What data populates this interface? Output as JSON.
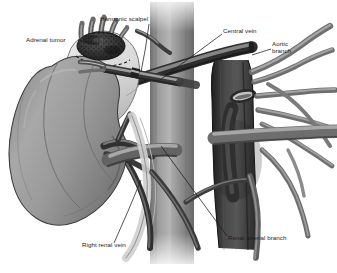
{
  "figure": {
    "type": "medical-illustration",
    "style": "grayscale line-and-tone anatomical drawing",
    "background_color": "#ffffff",
    "width": 337,
    "height": 273
  },
  "palette": {
    "background": "#ffffff",
    "kidney_fill": "#9a9a9a",
    "kidney_shadow": "#6f6f6f",
    "kidney_highlight": "#b5b5b5",
    "ivc_fill": "#8c8c8c",
    "ivc_highlight": "#b0b0b0",
    "ivc_shadow": "#6a6a6a",
    "aorta_fill": "#3d3d3d",
    "aorta_shadow": "#262626",
    "aorta_ostium": "#c9c9c9",
    "vein_dark": "#4a4a4a",
    "branch_gray": "#8f8f8f",
    "fat_pad": "#dedede",
    "tumor_dark": "#3a3a3a",
    "tumor_mottle": "#1e1e1e",
    "instrument": "#7c7c7c",
    "outline": "#2b2b2b",
    "label_text": "#1c1c1c",
    "leader_line": "#1c1c1c"
  },
  "labels": [
    {
      "id": "adrenal-tumor",
      "text": "Adrenal tumor",
      "x": 26,
      "y": 40,
      "align": "left",
      "lines": 1
    },
    {
      "id": "harmonic-scalpel",
      "text": "Harmonic scalpel",
      "x": 100,
      "y": 19,
      "align": "left",
      "lines": 1
    },
    {
      "id": "central-vein",
      "text": "Central vein",
      "x": 223,
      "y": 31,
      "align": "left",
      "lines": 1
    },
    {
      "id": "aortic-branch",
      "text": "Aortic\nbranch",
      "x": 272,
      "y": 44,
      "align": "left",
      "lines": 2
    },
    {
      "id": "right-renal-vein",
      "text": "Right renal vein",
      "x": 82,
      "y": 245,
      "align": "left",
      "lines": 1
    },
    {
      "id": "renal-arterial-branch",
      "text": "Renal arterial branch",
      "x": 228,
      "y": 238,
      "align": "left",
      "lines": 1
    }
  ],
  "leader_lines": [
    {
      "id": "leader-adrenal-tumor",
      "from": [
        78,
        40
      ],
      "to": [
        99,
        45
      ]
    },
    {
      "id": "leader-harmonic-scalpel",
      "from": [
        149,
        24
      ],
      "to": [
        141,
        72
      ]
    },
    {
      "id": "leader-central-vein",
      "from": [
        222,
        34
      ],
      "to": [
        160,
        80
      ]
    },
    {
      "id": "leader-aortic-branch",
      "from": [
        271,
        49
      ],
      "to": [
        252,
        55
      ]
    },
    {
      "id": "leader-right-renal-vein",
      "from": [
        114,
        243
      ],
      "to": [
        141,
        180
      ]
    },
    {
      "id": "leader-renal-arterial-branch",
      "from": [
        227,
        236
      ],
      "to": [
        161,
        146
      ]
    }
  ],
  "anatomy": [
    {
      "id": "kidney",
      "name": "Right kidney",
      "description": "large bean-shaped organ, left of frame"
    },
    {
      "id": "adrenal-gland",
      "name": "Adrenal gland / periadrenal fat",
      "description": "pale mass superior to kidney"
    },
    {
      "id": "adrenal-tumor-mass",
      "name": "Adrenal tumor",
      "description": "dark mottled nodule with vascular projections"
    },
    {
      "id": "inferior-vena-cava",
      "name": "Inferior vena cava",
      "description": "large vertical gray vessel, center"
    },
    {
      "id": "aorta",
      "name": "Aorta",
      "description": "dark vertical vessel right of IVC with ostium"
    },
    {
      "id": "central-vein-vessel",
      "name": "Central (adrenal) vein",
      "description": "dark tube crossing IVC obliquely"
    },
    {
      "id": "renal-vein-vessel",
      "name": "Right renal vein",
      "description": "horizontal vessel from hilum to IVC"
    },
    {
      "id": "renal-artery-vessel",
      "name": "Renal arterial branch",
      "description": "vessel from aorta to hilum"
    },
    {
      "id": "aortic-branches",
      "name": "Aortic branches",
      "description": "fan of tubular branches to the right"
    },
    {
      "id": "harmonic-scalpel-instrument",
      "name": "Harmonic scalpel",
      "description": "laparoscopic shaft with jaw at tumor base"
    }
  ]
}
